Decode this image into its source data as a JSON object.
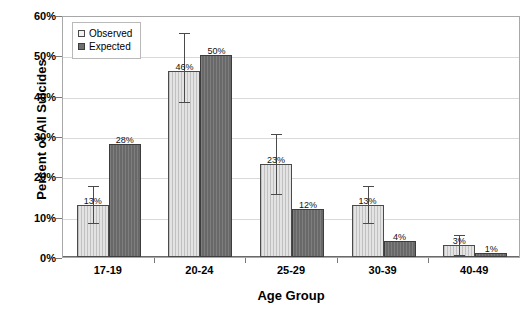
{
  "chart_data": {
    "type": "bar",
    "title": "",
    "xlabel": "Age Group",
    "ylabel": "Percent of All Suicides",
    "categories": [
      "17-19",
      "20-24",
      "25-29",
      "30-39",
      "40-49"
    ],
    "series": [
      {
        "name": "Observed",
        "values": [
          13,
          46,
          23,
          13,
          3
        ],
        "labels": [
          "13%",
          "46%",
          "23%",
          "13%",
          "3%"
        ],
        "error_low": [
          9,
          39,
          16,
          9,
          1
        ],
        "error_high": [
          18,
          56,
          31,
          18,
          6
        ],
        "color": "#e3e3e3"
      },
      {
        "name": "Expected",
        "values": [
          28,
          50,
          12,
          4,
          1
        ],
        "labels": [
          "28%",
          "50%",
          "12%",
          "4%",
          "1%"
        ],
        "color": "#6f6f6f"
      }
    ],
    "ylim": [
      0,
      60
    ],
    "yticks": [
      0,
      10,
      20,
      30,
      40,
      50,
      60
    ],
    "ytick_labels": [
      "0%",
      "10%",
      "20%",
      "30%",
      "40%",
      "50%",
      "60%"
    ],
    "grid": true,
    "legend_position": "top-left"
  },
  "legend": {
    "items": [
      {
        "label": "Observed",
        "swatch": "observed"
      },
      {
        "label": "Expected",
        "swatch": "expected"
      }
    ]
  },
  "axes": {
    "y_title": "Percent of All Suicides",
    "x_title": "Age Group"
  }
}
